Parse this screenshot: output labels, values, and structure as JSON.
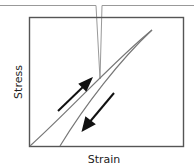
{
  "diagram": {
    "type": "stress-strain hysteresis loop",
    "x_axis_label": "Strain",
    "y_axis_label": "Stress",
    "callout": "callout box with pointer to loading curve",
    "arrows": [
      {
        "direction": "up",
        "meaning": "loading"
      },
      {
        "direction": "down",
        "meaning": "unloading"
      }
    ],
    "colors": {
      "axis": "#444444",
      "curve": "#555555",
      "arrow": "#111111",
      "callout": "#888888"
    }
  }
}
